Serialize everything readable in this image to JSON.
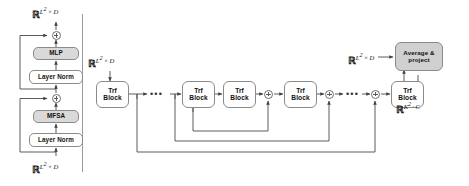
{
  "figure": {
    "name": "transformer-block-and-stack-diagram",
    "panels": [
      "encoder-block-detail",
      "block-stack-with-residuals"
    ]
  },
  "left_panel": {
    "name": "transformer-block-detail",
    "output_label": {
      "base": "R",
      "sup": "L2 × D",
      "text": "ℝ^{L²×D}"
    },
    "input_label": {
      "base": "R",
      "sup": "L2 × D",
      "text": "ℝ^{L²×D}"
    },
    "nodes": [
      {
        "id": "add-top",
        "label": "+",
        "type": "sum"
      },
      {
        "id": "mlp",
        "label": "MLP",
        "type": "box",
        "fill": "#d9d9d9"
      },
      {
        "id": "layer-norm-top",
        "label": "Layer Norm",
        "type": "box",
        "fill": "#ffffff"
      },
      {
        "id": "add-bottom",
        "label": "+",
        "type": "sum"
      },
      {
        "id": "mfsa",
        "label": "MFSA",
        "type": "box",
        "fill": "#d9d9d9"
      },
      {
        "id": "layer-norm-bottom",
        "label": "Layer Norm",
        "type": "box",
        "fill": "#ffffff"
      }
    ]
  },
  "right_panel": {
    "name": "transformer-stack",
    "input_label": {
      "text": "ℝ^{L²×D}"
    },
    "pre_head_label": {
      "text": "ℝ^{L²×D}"
    },
    "output_label": {
      "text": "ℝ^{K²·C}"
    },
    "block_label_line1": "Trf",
    "block_label_line2": "Block",
    "blocks": [
      {
        "id": "trf-block-1",
        "label": "Trf Block"
      },
      {
        "id": "trf-block-2",
        "label": "Trf Block"
      },
      {
        "id": "trf-block-3",
        "label": "Trf Block"
      },
      {
        "id": "trf-block-4",
        "label": "Trf Block"
      },
      {
        "id": "trf-block-5",
        "label": "Trf Block"
      }
    ],
    "sums": [
      {
        "id": "sum-1",
        "label": "+"
      },
      {
        "id": "sum-2",
        "label": "+"
      },
      {
        "id": "sum-3",
        "label": "+"
      }
    ],
    "ellipses": [
      {
        "id": "ellipsis-1",
        "label": "•••"
      },
      {
        "id": "ellipsis-2",
        "label": "•••"
      }
    ],
    "head": {
      "id": "average-and-project",
      "label_line1": "Average &",
      "label_line2": "project",
      "fill": "#d0d0d0"
    }
  },
  "colors": {
    "stroke": "#8a8a8a",
    "wire": "#4a4a4a",
    "gray_fill": "#d9d9d9",
    "head_fill": "#d0d0d0",
    "background": "#ffffff",
    "text": "#111111"
  }
}
